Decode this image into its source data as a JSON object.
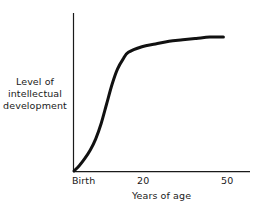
{
  "chart_data": {
    "type": "line",
    "title": "",
    "subtitle": "",
    "xlabel": "Years of age",
    "ylabel": "Level of intellectual development",
    "ylabel_lines": [
      "Level of",
      "intellectual",
      "development"
    ],
    "x_tick_labels": [
      "Birth",
      "20",
      "50"
    ],
    "x_tick_values": [
      0,
      20,
      50
    ],
    "y_tick_labels": [],
    "xlim": [
      0,
      60
    ],
    "ylim": [
      0,
      100
    ],
    "grid": false,
    "legend": false,
    "axes_style": "open-left-bottom",
    "line_color": "#111111",
    "line_width_px": 3,
    "background_color": "#ffffff",
    "series": [
      {
        "name": "Intellectual development",
        "description": "S-shaped (sigmoid) growth curve: slow from birth, steep rise through childhood and adolescence, plateau after about age 20",
        "x": [
          0,
          2,
          4,
          6,
          8,
          10,
          12,
          14,
          16,
          18,
          20,
          25,
          30,
          35,
          40,
          45,
          50,
          55
        ],
        "values": [
          0,
          4,
          9,
          15,
          23,
          34,
          48,
          62,
          73,
          80,
          85,
          89,
          91,
          93,
          94,
          95,
          96,
          96
        ]
      }
    ],
    "annotations": []
  },
  "axes": {
    "y_axis_name": "y-axis-line",
    "x_axis_name": "x-axis-line"
  }
}
